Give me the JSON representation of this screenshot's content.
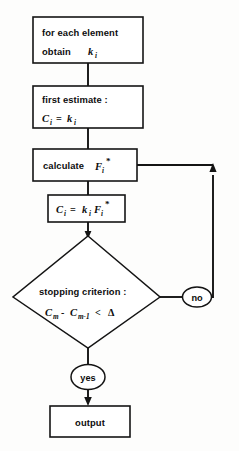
{
  "diagram": {
    "type": "flowchart",
    "colors": {
      "stroke": "#141414",
      "fill": "#ffffff",
      "background": "#fdfdfc"
    },
    "nodes": [
      {
        "id": "for-each-element",
        "shape": "rectangle",
        "line1": "for each element",
        "line2_prefix": "obtain",
        "line2_var": "k",
        "line2_sub": "i"
      },
      {
        "id": "first-estimate",
        "shape": "rectangle",
        "line1": "first estimate :",
        "eq_lhs": "C",
        "eq_lhs_sub": "i",
        "eq_op": "=",
        "eq_rhs": "k",
        "eq_rhs_sub": "i"
      },
      {
        "id": "calculate-f",
        "shape": "rectangle",
        "text": "calculate",
        "var": "F",
        "sub": "i",
        "sup": "*"
      },
      {
        "id": "update-c",
        "shape": "rectangle",
        "lhs": "C",
        "lhs_sub": "i",
        "op": "=",
        "rhs1": "k",
        "rhs1_sub": "i",
        "rhs2": "F",
        "rhs2_sub": "i",
        "rhs2_sup": "*"
      },
      {
        "id": "stopping-criterion",
        "shape": "diamond",
        "line1": "stopping criterion :",
        "eq_a": "C",
        "eq_a_sub": "m",
        "eq_minus": "-",
        "eq_b": "C",
        "eq_b_sub": "m-1",
        "eq_lt": "<",
        "eq_delta": "Δ"
      },
      {
        "id": "branch-no",
        "shape": "ellipse",
        "label": "no"
      },
      {
        "id": "branch-yes",
        "shape": "ellipse",
        "label": "yes"
      },
      {
        "id": "output",
        "shape": "rectangle",
        "label": "output"
      }
    ],
    "edges": [
      {
        "id": "e1",
        "from": "for-each-element",
        "to": "first-estimate",
        "label": ""
      },
      {
        "id": "e2",
        "from": "first-estimate",
        "to": "calculate-f",
        "label": ""
      },
      {
        "id": "e3",
        "from": "calculate-f",
        "to": "update-c",
        "label": ""
      },
      {
        "id": "e4",
        "from": "update-c",
        "to": "stopping-criterion",
        "label": ""
      },
      {
        "id": "e5",
        "from": "stopping-criterion",
        "to": "branch-no",
        "label": "no"
      },
      {
        "id": "e6",
        "from": "branch-no",
        "to": "calculate-f",
        "label": "feedback-loop"
      },
      {
        "id": "e7",
        "from": "stopping-criterion",
        "to": "branch-yes",
        "label": "yes"
      },
      {
        "id": "e8",
        "from": "branch-yes",
        "to": "output",
        "label": ""
      }
    ]
  }
}
